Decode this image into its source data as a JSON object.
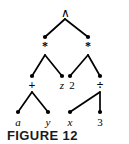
{
  "figure": {
    "caption": "FIGURE 12",
    "background_color": "#ffffff",
    "ink_color": "#000000"
  },
  "chart_data": {
    "type": "diagram",
    "diagram_kind": "binary-expression-tree",
    "title": "FIGURE 12",
    "expression": "((a + y) * z) ^ (2 * (x / 3))",
    "nodes": [
      {
        "id": "n0",
        "label": "∧",
        "kind": "operator",
        "style": "upright",
        "depth": 0,
        "x": 65,
        "y": 13
      },
      {
        "id": "n1",
        "label": "*",
        "kind": "operator",
        "style": "upright",
        "depth": 1,
        "x": 45,
        "y": 46
      },
      {
        "id": "n2",
        "label": "*",
        "kind": "operator",
        "style": "upright",
        "depth": 1,
        "x": 88,
        "y": 46
      },
      {
        "id": "n3",
        "label": "+",
        "kind": "operator",
        "style": "upright",
        "depth": 2,
        "x": 32,
        "y": 85
      },
      {
        "id": "n4",
        "label": "z",
        "kind": "variable",
        "style": "italic",
        "depth": 2,
        "x": 62,
        "y": 85
      },
      {
        "id": "n5",
        "label": "2",
        "kind": "number",
        "style": "upright",
        "depth": 2,
        "x": 72,
        "y": 85
      },
      {
        "id": "n6",
        "label": "÷",
        "kind": "operator",
        "style": "upright",
        "depth": 2,
        "x": 100,
        "y": 85
      },
      {
        "id": "n7",
        "label": "a",
        "kind": "variable",
        "style": "italic",
        "depth": 3,
        "x": 18,
        "y": 122
      },
      {
        "id": "n8",
        "label": "y",
        "kind": "variable",
        "style": "italic",
        "depth": 3,
        "x": 48,
        "y": 122
      },
      {
        "id": "n9",
        "label": "x",
        "kind": "variable",
        "style": "italic",
        "depth": 3,
        "x": 70,
        "y": 122
      },
      {
        "id": "n10",
        "label": "3",
        "kind": "number",
        "style": "upright",
        "depth": 3,
        "x": 100,
        "y": 122
      }
    ],
    "dots": [
      {
        "id": "d1",
        "x": 45,
        "y": 37
      },
      {
        "id": "d2",
        "x": 88,
        "y": 37
      },
      {
        "id": "d3",
        "x": 32,
        "y": 76
      },
      {
        "id": "d4",
        "x": 62,
        "y": 76
      },
      {
        "id": "d5",
        "x": 70,
        "y": 76
      },
      {
        "id": "d6",
        "x": 100,
        "y": 76
      },
      {
        "id": "d7",
        "x": 18,
        "y": 112
      },
      {
        "id": "d8",
        "x": 48,
        "y": 112
      },
      {
        "id": "d9",
        "x": 70,
        "y": 112
      },
      {
        "id": "d10",
        "x": 100,
        "y": 112
      }
    ],
    "edges": [
      {
        "from": "n0",
        "to": "n1",
        "x1": 65,
        "y1": 19,
        "x2": 45,
        "y2": 37
      },
      {
        "from": "n0",
        "to": "n2",
        "x1": 65,
        "y1": 19,
        "x2": 88,
        "y2": 37
      },
      {
        "from": "n1",
        "to": "n3",
        "x1": 45,
        "y1": 55,
        "x2": 32,
        "y2": 76
      },
      {
        "from": "n1",
        "to": "n4",
        "x1": 45,
        "y1": 55,
        "x2": 62,
        "y2": 76
      },
      {
        "from": "n2",
        "to": "n5",
        "x1": 88,
        "y1": 55,
        "x2": 70,
        "y2": 76
      },
      {
        "from": "n2",
        "to": "n6",
        "x1": 88,
        "y1": 55,
        "x2": 100,
        "y2": 76
      },
      {
        "from": "n3",
        "to": "n7",
        "x1": 32,
        "y1": 92,
        "x2": 18,
        "y2": 112
      },
      {
        "from": "n3",
        "to": "n8",
        "x1": 32,
        "y1": 92,
        "x2": 48,
        "y2": 112
      },
      {
        "from": "n6",
        "to": "n9",
        "x1": 100,
        "y1": 92,
        "x2": 70,
        "y2": 112
      },
      {
        "from": "n6",
        "to": "n10",
        "x1": 100,
        "y1": 92,
        "x2": 100,
        "y2": 112
      }
    ],
    "dot_radius": 2.1,
    "edge_width": 1.7
  }
}
